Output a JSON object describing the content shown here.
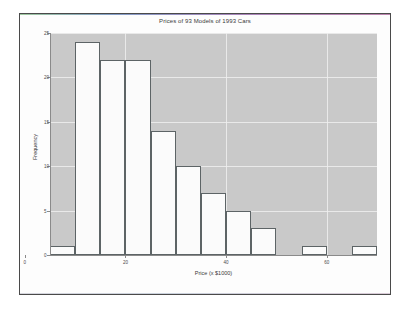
{
  "figure": {
    "background": "#fdfdfd",
    "frame_color": "#4a4a4a",
    "panel_color": "#c9c9c9",
    "grid_color": "#efefef",
    "bar_fill": "#fbfbfb",
    "bar_edge": "#5d6466"
  },
  "chart_data": {
    "type": "bar",
    "title": "Prices of 93 Models of 1993 Cars",
    "xlabel": "Price (x $1000)",
    "ylabel": "Frequency",
    "grid": true,
    "legend": "none",
    "bin_width": 5,
    "bin_edges": [
      5,
      10,
      15,
      20,
      25,
      30,
      35,
      40,
      45,
      50,
      55,
      60,
      65,
      70
    ],
    "categories": [
      "5-10",
      "10-15",
      "15-20",
      "20-25",
      "25-30",
      "30-35",
      "35-40",
      "40-45",
      "45-50",
      "50-55",
      "55-60",
      "60-65",
      "65-70"
    ],
    "x": [
      7.5,
      12.5,
      17.5,
      22.5,
      27.5,
      32.5,
      37.5,
      42.5,
      47.5,
      52.5,
      57.5,
      62.5,
      67.5
    ],
    "values": [
      1,
      24,
      22,
      22,
      14,
      10,
      7,
      5,
      3,
      0,
      1,
      0,
      1
    ],
    "xlim": [
      5,
      70
    ],
    "ylim": [
      0,
      25
    ],
    "xticks": [
      0,
      20,
      40,
      60
    ],
    "xticklabels": [
      "0",
      "20",
      "40",
      "60"
    ],
    "yticks": [
      0,
      5,
      10,
      15,
      20,
      25
    ],
    "yticklabels": [
      "0",
      "5",
      "10",
      "15",
      "20",
      "25"
    ]
  }
}
